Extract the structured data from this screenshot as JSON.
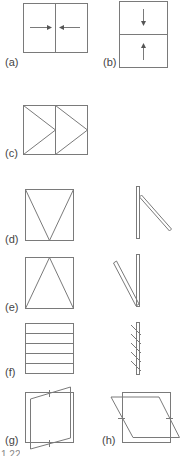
{
  "figure": {
    "caption_fragment": "1.22",
    "stroke_color": "#7a7a7a",
    "panels": [
      {
        "id": "a",
        "label": "(a)",
        "type": "horizontal-sliding"
      },
      {
        "id": "b",
        "label": "(b)",
        "type": "vertical-sliding"
      },
      {
        "id": "c",
        "label": "(c)",
        "type": "side-hung-casement"
      },
      {
        "id": "d",
        "label": "(d)",
        "type": "top-hung",
        "has_side_view": true
      },
      {
        "id": "e",
        "label": "(e)",
        "type": "bottom-hung",
        "has_side_view": true
      },
      {
        "id": "f",
        "label": "(f)",
        "type": "louvred",
        "has_side_view": true
      },
      {
        "id": "g",
        "label": "(g)",
        "type": "vertical-pivot"
      },
      {
        "id": "h",
        "label": "(h)",
        "type": "horizontal-pivot"
      }
    ]
  }
}
